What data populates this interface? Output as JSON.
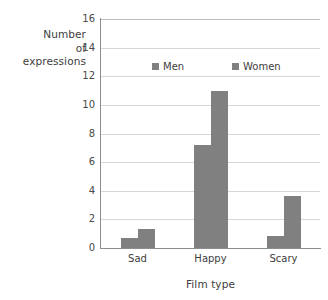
{
  "chart_data": {
    "type": "bar",
    "title": "",
    "subtitle": "",
    "xlabel": "Film type",
    "ylabel": "Number of expressions",
    "ylabel_lines": [
      "Number",
      "of",
      "expressions"
    ],
    "categories": [
      "Sad",
      "Happy",
      "Scary"
    ],
    "series": [
      {
        "name": "Men",
        "values": [
          0.7,
          7.2,
          0.85
        ],
        "color": "#808080"
      },
      {
        "name": "Women",
        "values": [
          1.3,
          11.0,
          3.6
        ],
        "color": "#808080"
      }
    ],
    "ylim": [
      0,
      16
    ],
    "ytick_values": [
      0,
      2,
      4,
      6,
      8,
      10,
      12,
      14,
      16
    ],
    "ytick_labels": [
      "0",
      "2",
      "4",
      "6",
      "8",
      "10",
      "12",
      "14",
      "16"
    ],
    "grid": "horizontal",
    "legend_position": "inside-top-center",
    "annotations": []
  },
  "legend": {
    "entries": [
      {
        "label": "Men"
      },
      {
        "label": "Women"
      }
    ]
  },
  "colors": {
    "bar": "#808080",
    "gridline": "#d6d6d6",
    "axis": "#8d8d8d",
    "text": "#3d3d3d",
    "background": "#ffffff"
  }
}
